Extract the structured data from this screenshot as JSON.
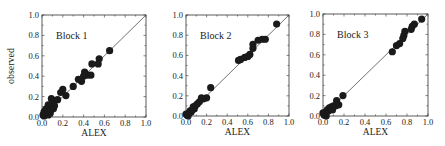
{
  "figure": {
    "ylabel": "observed",
    "xlabel": "ALEX",
    "tick_labels": [
      "0.0",
      "0.2",
      "0.4",
      "0.6",
      "0.8",
      "1.0"
    ]
  },
  "chart_data": [
    {
      "type": "scatter",
      "title": "Block 1",
      "xlabel": "ALEX",
      "ylabel": "observed",
      "xlim": [
        0,
        1
      ],
      "ylim": [
        0,
        1
      ],
      "xticks": [
        0.0,
        0.2,
        0.4,
        0.6,
        0.8,
        1.0
      ],
      "yticks": [
        0.0,
        0.2,
        0.4,
        0.6,
        0.8,
        1.0
      ],
      "reference_line": "y = x",
      "grid": false,
      "points": [
        [
          0.65,
          0.65
        ],
        [
          0.55,
          0.57
        ],
        [
          0.54,
          0.52
        ],
        [
          0.48,
          0.52
        ],
        [
          0.47,
          0.41
        ],
        [
          0.44,
          0.41
        ],
        [
          0.41,
          0.44
        ],
        [
          0.4,
          0.4
        ],
        [
          0.38,
          0.35
        ],
        [
          0.35,
          0.37
        ],
        [
          0.3,
          0.3
        ],
        [
          0.2,
          0.27
        ],
        [
          0.18,
          0.24
        ],
        [
          0.23,
          0.21
        ],
        [
          0.15,
          0.17
        ],
        [
          0.12,
          0.16
        ],
        [
          0.09,
          0.18
        ],
        [
          0.1,
          0.13
        ],
        [
          0.08,
          0.1
        ],
        [
          0.06,
          0.12
        ],
        [
          0.07,
          0.07
        ],
        [
          0.05,
          0.05
        ],
        [
          0.04,
          0.08
        ],
        [
          0.03,
          0.03
        ],
        [
          0.02,
          0.01
        ],
        [
          0.01,
          0.02
        ],
        [
          0.11,
          0.08
        ],
        [
          0.06,
          0.02
        ],
        [
          0.03,
          0.06
        ],
        [
          0.12,
          0.11
        ],
        [
          0.08,
          0.04
        ],
        [
          0.02,
          0.05
        ]
      ]
    },
    {
      "type": "scatter",
      "title": "Block 2",
      "xlabel": "ALEX",
      "ylabel": "",
      "xlim": [
        0,
        1
      ],
      "ylim": [
        0,
        1
      ],
      "xticks": [
        0.0,
        0.2,
        0.4,
        0.6,
        0.8,
        1.0
      ],
      "yticks": [
        0.0,
        0.2,
        0.4,
        0.6,
        0.8,
        1.0
      ],
      "reference_line": "y = x",
      "grid": false,
      "points": [
        [
          0.88,
          0.91
        ],
        [
          0.77,
          0.76
        ],
        [
          0.74,
          0.76
        ],
        [
          0.7,
          0.75
        ],
        [
          0.65,
          0.71
        ],
        [
          0.65,
          0.67
        ],
        [
          0.62,
          0.61
        ],
        [
          0.6,
          0.59
        ],
        [
          0.57,
          0.58
        ],
        [
          0.53,
          0.56
        ],
        [
          0.51,
          0.55
        ],
        [
          0.24,
          0.28
        ],
        [
          0.2,
          0.18
        ],
        [
          0.17,
          0.17
        ],
        [
          0.15,
          0.18
        ],
        [
          0.13,
          0.14
        ],
        [
          0.11,
          0.12
        ],
        [
          0.09,
          0.1
        ],
        [
          0.08,
          0.07
        ],
        [
          0.07,
          0.09
        ],
        [
          0.06,
          0.06
        ],
        [
          0.05,
          0.04
        ],
        [
          0.04,
          0.05
        ],
        [
          0.03,
          0.03
        ],
        [
          0.02,
          0.02
        ],
        [
          0.01,
          0.01
        ],
        [
          0.02,
          0.0
        ],
        [
          0.0,
          0.02
        ]
      ]
    },
    {
      "type": "scatter",
      "title": "Block 3",
      "xlabel": "ALEX",
      "ylabel": "",
      "xlim": [
        0,
        1
      ],
      "ylim": [
        0,
        1
      ],
      "xticks": [
        0.0,
        0.2,
        0.4,
        0.6,
        0.8,
        1.0
      ],
      "yticks": [
        0.0,
        0.2,
        0.4,
        0.6,
        0.8,
        1.0
      ],
      "reference_line": "y = x",
      "grid": false,
      "points": [
        [
          0.94,
          0.95
        ],
        [
          0.87,
          0.9
        ],
        [
          0.85,
          0.88
        ],
        [
          0.84,
          0.85
        ],
        [
          0.78,
          0.83
        ],
        [
          0.77,
          0.79
        ],
        [
          0.76,
          0.76
        ],
        [
          0.73,
          0.71
        ],
        [
          0.7,
          0.69
        ],
        [
          0.66,
          0.63
        ],
        [
          0.19,
          0.2
        ],
        [
          0.13,
          0.15
        ],
        [
          0.12,
          0.1
        ],
        [
          0.15,
          0.11
        ],
        [
          0.1,
          0.1
        ],
        [
          0.08,
          0.09
        ],
        [
          0.07,
          0.07
        ],
        [
          0.06,
          0.08
        ],
        [
          0.05,
          0.05
        ],
        [
          0.04,
          0.06
        ],
        [
          0.03,
          0.04
        ],
        [
          0.02,
          0.02
        ],
        [
          0.01,
          0.01
        ],
        [
          0.03,
          0.0
        ],
        [
          0.0,
          0.03
        ],
        [
          0.09,
          0.06
        ]
      ]
    }
  ]
}
